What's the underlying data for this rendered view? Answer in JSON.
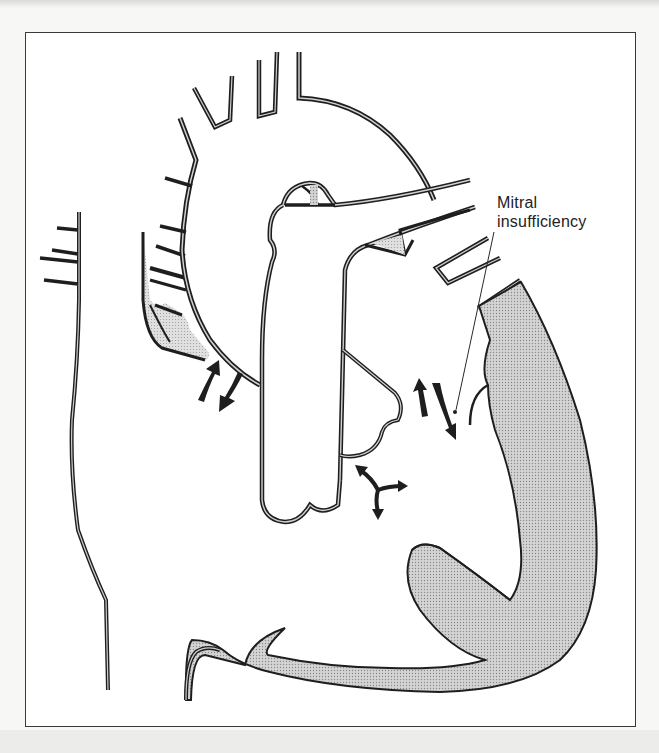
{
  "figure": {
    "type": "anatomical-illustration",
    "labels": [
      {
        "id": "mitral",
        "text_line1": "Mitral",
        "text_line2": "insufficiency"
      }
    ],
    "annotation": {
      "label": "Mitral insufficiency",
      "points_to": "mitral valve regurgitation arrows"
    },
    "arrows": [
      {
        "name": "atrial-septum-flow",
        "description": "bidirectional curved arrows near right atrium"
      },
      {
        "name": "mitral-regurgitation-flow",
        "description": "bidirectional arrows at mitral valve"
      },
      {
        "name": "ventricular-flow",
        "description": "three-way branching arrow below valves"
      }
    ],
    "colors": {
      "outline": "#1e1e1e",
      "wall_fill": "#c8c8c8",
      "background": "#ffffff",
      "frame": "#3a3a3a"
    }
  }
}
